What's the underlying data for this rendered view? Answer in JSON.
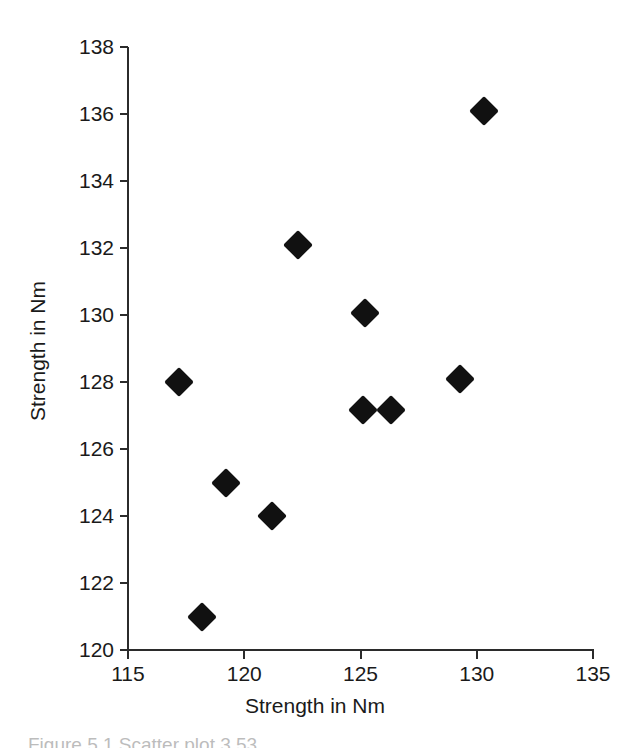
{
  "chart_data": {
    "type": "scatter",
    "title": "",
    "xlabel": "Strength in Nm",
    "ylabel": "Strength in Nm",
    "xlim": [
      115,
      135
    ],
    "ylim": [
      120,
      138
    ],
    "xticks": [
      115,
      120,
      125,
      130,
      135
    ],
    "yticks": [
      120,
      122,
      124,
      126,
      128,
      130,
      132,
      134,
      136,
      138
    ],
    "xtick_labels": [
      "115",
      "120",
      "125",
      "130",
      "135"
    ],
    "ytick_labels": [
      "120",
      "122",
      "124",
      "126",
      "128",
      "130",
      "132",
      "134",
      "136",
      "138"
    ],
    "grid": false,
    "legend": false,
    "marker_shape": "filled-diamond",
    "marker_color": "#111111",
    "points": [
      {
        "x": 117.2,
        "y": 128.0
      },
      {
        "x": 118.2,
        "y": 121.0
      },
      {
        "x": 119.2,
        "y": 125.0
      },
      {
        "x": 121.2,
        "y": 124.0
      },
      {
        "x": 122.3,
        "y": 132.1
      },
      {
        "x": 125.1,
        "y": 127.15
      },
      {
        "x": 125.2,
        "y": 130.05
      },
      {
        "x": 126.3,
        "y": 127.15
      },
      {
        "x": 129.3,
        "y": 128.1
      },
      {
        "x": 130.3,
        "y": 136.1
      }
    ]
  },
  "caption": {
    "text": "Figure 5.1  Scatter plot 3.53"
  },
  "colors": {
    "axis": "#2b2b2b",
    "text": "#1a1a1a",
    "marker": "#111111",
    "background": "#ffffff"
  }
}
